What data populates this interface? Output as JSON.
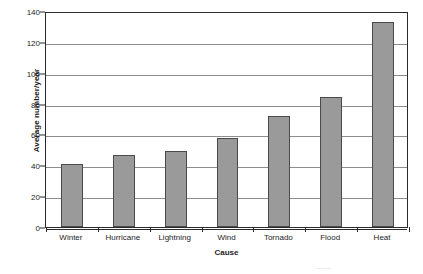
{
  "chart_data": {
    "type": "bar",
    "title": "",
    "xlabel": "Cause",
    "ylabel": "Average number/year",
    "categories": [
      "Winter",
      "Hurricane",
      "Lightning",
      "Wind",
      "Tornado",
      "Flood",
      "Heat"
    ],
    "values": [
      41,
      47,
      49.5,
      57.5,
      72,
      84.5,
      133
    ],
    "ylim": [
      0,
      140
    ],
    "yticks": [
      0,
      20,
      40,
      60,
      80,
      100,
      120,
      140
    ],
    "ytick_labels": [
      "0",
      "20",
      "40",
      "60",
      "80",
      "100",
      "120",
      "140"
    ],
    "grid": true,
    "grid_axis": "y",
    "legend": false,
    "legend_position": "none",
    "series": [
      {
        "name": "Average number/year",
        "values": [
          41,
          47,
          49.5,
          57.5,
          72,
          84.5,
          133
        ]
      }
    ]
  },
  "colors": {
    "bar_fill": "#9a9a9a",
    "bar_edge": "#4a4a4a",
    "frame": "#2b2b2b",
    "gridline": "#8d8d8d",
    "text": "#1c1c1c",
    "background": "#ffffff"
  },
  "footer": {
    "source_text": "......."
  }
}
